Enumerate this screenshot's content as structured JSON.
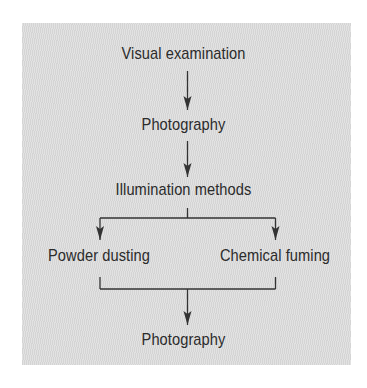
{
  "diagram": {
    "type": "flowchart",
    "colors": {
      "panel_background": "#dcdcdc",
      "text": "#2b2b2b",
      "lines": "#333333"
    },
    "nodes": [
      {
        "id": "visual",
        "label": "Visual examination"
      },
      {
        "id": "photo1",
        "label": "Photography"
      },
      {
        "id": "illum",
        "label": "Illumination methods"
      },
      {
        "id": "powder",
        "label": "Powder dusting"
      },
      {
        "id": "chemical",
        "label": "Chemical fuming"
      },
      {
        "id": "photo2",
        "label": "Photography"
      }
    ],
    "edges": [
      {
        "from": "visual",
        "to": "photo1"
      },
      {
        "from": "photo1",
        "to": "illum"
      },
      {
        "from": "illum",
        "to": "powder"
      },
      {
        "from": "illum",
        "to": "chemical"
      },
      {
        "from": "powder",
        "to": "photo2"
      },
      {
        "from": "chemical",
        "to": "photo2"
      }
    ]
  }
}
